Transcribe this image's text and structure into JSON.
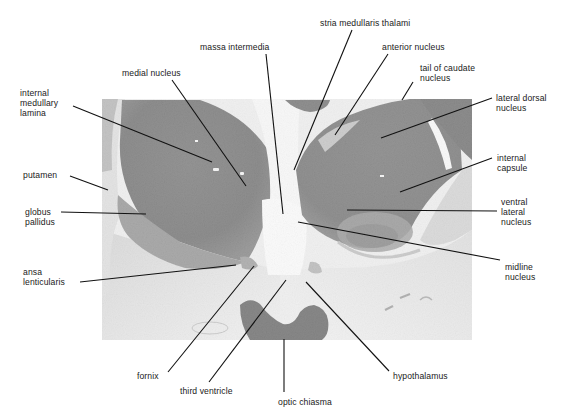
{
  "figure": {
    "photo_bounds": {
      "x": 102,
      "y": 99,
      "width": 370,
      "height": 241
    },
    "colors": {
      "background": "#ffffff",
      "tissue_dark": "#1e1e1e",
      "tissue_mid": "#5a5a5a",
      "tissue_light": "#d6d6d6",
      "ventricle": "#f2f2f2",
      "optic_chiasma": "#111111",
      "leader_line": "#111111"
    }
  },
  "labels": [
    {
      "id": "stria-medullaris-thalami",
      "text": "stria medullaris thalami",
      "x": 320,
      "y": 18,
      "align": "left"
    },
    {
      "id": "massa-intermedia",
      "text": "massa intermedia",
      "x": 200,
      "y": 42,
      "align": "left"
    },
    {
      "id": "anterior-nucleus",
      "text": "anterior nucleus",
      "x": 382,
      "y": 42,
      "align": "left"
    },
    {
      "id": "medial-nucleus",
      "text": "medial nucleus",
      "x": 122,
      "y": 68,
      "align": "left"
    },
    {
      "id": "tail-of-caudate-nucleus",
      "text": "tail of caudate\nnucleus",
      "x": 420,
      "y": 63,
      "align": "left"
    },
    {
      "id": "internal-medullary-lamina",
      "text": "internal\nmedullary\nlamina",
      "x": 20,
      "y": 88,
      "align": "left"
    },
    {
      "id": "lateral-dorsal-nucleus",
      "text": "lateral dorsal\nnucleus",
      "x": 496,
      "y": 93,
      "align": "left"
    },
    {
      "id": "putamen",
      "text": "putamen",
      "x": 23,
      "y": 170,
      "align": "left"
    },
    {
      "id": "internal-capsule",
      "text": "internal\ncapsule",
      "x": 497,
      "y": 153,
      "align": "left"
    },
    {
      "id": "globus-pallidus",
      "text": "globus\npallidus",
      "x": 25,
      "y": 207,
      "align": "left"
    },
    {
      "id": "ventral-lateral-nucleus",
      "text": "ventral\nlateral\nnucleus",
      "x": 501,
      "y": 197,
      "align": "left"
    },
    {
      "id": "ansa-lenticularis",
      "text": "ansa\nlenticularis",
      "x": 23,
      "y": 267,
      "align": "left"
    },
    {
      "id": "midline-nucleus",
      "text": "midline\nnucleus",
      "x": 505,
      "y": 262,
      "align": "left"
    },
    {
      "id": "fornix",
      "text": "fornix",
      "x": 137,
      "y": 371,
      "align": "left"
    },
    {
      "id": "third-ventricle",
      "text": "third ventricle",
      "x": 180,
      "y": 386,
      "align": "left"
    },
    {
      "id": "hypothalamus",
      "text": "hypothalamus",
      "x": 393,
      "y": 371,
      "align": "left"
    },
    {
      "id": "optic-chiasma",
      "text": "optic chiasma",
      "x": 278,
      "y": 397,
      "align": "left"
    }
  ],
  "leaders": [
    {
      "id": "stria-medullaris-thalami",
      "x1": 352,
      "y1": 30,
      "x2": 294,
      "y2": 170
    },
    {
      "id": "massa-intermedia",
      "x1": 266,
      "y1": 54,
      "x2": 283,
      "y2": 214
    },
    {
      "id": "anterior-nucleus",
      "x1": 388,
      "y1": 54,
      "x2": 335,
      "y2": 135
    },
    {
      "id": "medial-nucleus",
      "x1": 172,
      "y1": 80,
      "x2": 246,
      "y2": 186
    },
    {
      "id": "tail-of-caudate-nucleus",
      "x1": 413,
      "y1": 82,
      "x2": 402,
      "y2": 100
    },
    {
      "id": "internal-medullary-lamina",
      "x1": 73,
      "y1": 106,
      "x2": 212,
      "y2": 162
    },
    {
      "id": "lateral-dorsal-nucleus",
      "x1": 492,
      "y1": 98,
      "x2": 381,
      "y2": 138
    },
    {
      "id": "putamen",
      "x1": 70,
      "y1": 176,
      "x2": 108,
      "y2": 190
    },
    {
      "id": "internal-capsule",
      "x1": 492,
      "y1": 158,
      "x2": 400,
      "y2": 192
    },
    {
      "id": "globus-pallidus",
      "x1": 61,
      "y1": 212,
      "x2": 146,
      "y2": 214
    },
    {
      "id": "ventral-lateral-nucleus",
      "x1": 497,
      "y1": 211,
      "x2": 347,
      "y2": 210
    },
    {
      "id": "ansa-lenticularis",
      "x1": 80,
      "y1": 282,
      "x2": 236,
      "y2": 265
    },
    {
      "id": "midline-nucleus",
      "x1": 500,
      "y1": 260,
      "x2": 298,
      "y2": 222
    },
    {
      "id": "fornix",
      "x1": 168,
      "y1": 372,
      "x2": 254,
      "y2": 266
    },
    {
      "id": "third-ventricle",
      "x1": 209,
      "y1": 382,
      "x2": 286,
      "y2": 280
    },
    {
      "id": "hypothalamus",
      "x1": 389,
      "y1": 371,
      "x2": 306,
      "y2": 282
    },
    {
      "id": "optic-chiasma",
      "x1": 284,
      "y1": 339,
      "x2": 284,
      "y2": 392
    }
  ]
}
